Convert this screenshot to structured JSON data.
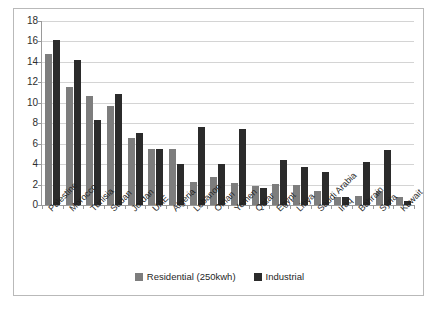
{
  "chart_data": {
    "type": "bar",
    "title": "",
    "xlabel": "",
    "ylabel": "",
    "ylim": [
      0,
      18
    ],
    "y_ticks": [
      0,
      2,
      4,
      6,
      8,
      10,
      12,
      14,
      16,
      18
    ],
    "grid": true,
    "legend_position": "bottom",
    "categories": [
      "Palestine",
      "Morocco",
      "Tunisia",
      "Sudan",
      "Jordan",
      "UAE",
      "Algeria",
      "Lebanon",
      "Oman",
      "Yemen",
      "Qatar",
      "Egypt",
      "Libya",
      "Saudi Arabia",
      "Iraq",
      "Bahrain",
      "Syria",
      "Kuwait"
    ],
    "series": [
      {
        "name": "Residential (250kwh)",
        "color": "#7d7d7d",
        "values": [
          14.8,
          11.5,
          10.7,
          9.7,
          6.6,
          5.5,
          5.5,
          2.3,
          2.7,
          2.2,
          1.9,
          2.1,
          2.0,
          1.4,
          0.8,
          0.9,
          1.4,
          0.75
        ]
      },
      {
        "name": "Industrial",
        "color": "#2b2b2b",
        "values": [
          16.1,
          14.2,
          8.3,
          10.9,
          7.0,
          5.5,
          4.0,
          7.6,
          4.0,
          7.4,
          1.7,
          4.4,
          3.7,
          3.2,
          0.75,
          4.2,
          5.4,
          0.4
        ]
      }
    ]
  },
  "legend": {
    "items": [
      {
        "label": "Residential (250kwh)",
        "color": "#7d7d7d"
      },
      {
        "label": "Industrial",
        "color": "#2b2b2b"
      }
    ]
  }
}
